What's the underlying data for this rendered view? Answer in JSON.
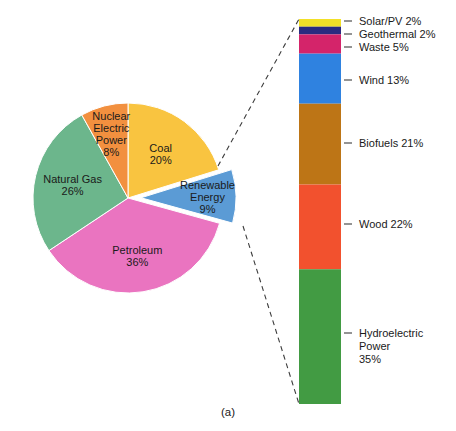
{
  "figure": {
    "caption": "(a)",
    "background": "#ffffff"
  },
  "chart_data": [
    {
      "type": "pie",
      "title": "",
      "name": "us-energy-consumption-by-source",
      "categories": [
        "Coal",
        "Renewable Energy",
        "Petroleum",
        "Natural Gas",
        "Nuclear Electric Power"
      ],
      "values": [
        20,
        9,
        36,
        26,
        8
      ],
      "unit": "%",
      "legend": "none",
      "exploded": [
        "Renewable Energy"
      ],
      "slices": [
        {
          "label": "Coal",
          "label_lines": [
            "Coal",
            "20%"
          ],
          "value": 20,
          "color": "#f9c440",
          "exploded": false
        },
        {
          "label": "Renewable Energy",
          "label_lines": [
            "Renewable",
            "Energy",
            "9%"
          ],
          "value": 9,
          "color": "#5b9bd5",
          "exploded": true
        },
        {
          "label": "Petroleum",
          "label_lines": [
            "Petroleum",
            "36%"
          ],
          "value": 36,
          "color": "#ea74c0",
          "exploded": false
        },
        {
          "label": "Natural Gas",
          "label_lines": [
            "Natural Gas",
            "26%"
          ],
          "value": 26,
          "color": "#6cb68c",
          "exploded": false
        },
        {
          "label": "Nuclear Electric Power",
          "label_lines": [
            "Nuclear",
            "Electric",
            "Power",
            "8%"
          ],
          "value": 8,
          "color": "#f2903f",
          "exploded": false
        }
      ]
    },
    {
      "type": "bar",
      "subtype": "stacked-vertical",
      "title": "",
      "name": "renewable-energy-breakdown",
      "categories": [
        "Solar/PV",
        "Geothermal",
        "Waste",
        "Wind",
        "Biofuels",
        "Wood",
        "Hydroelectric Power"
      ],
      "values": [
        2,
        2,
        5,
        13,
        21,
        22,
        35
      ],
      "unit": "%",
      "legend": "right-labels",
      "segments": [
        {
          "label": "Solar/PV",
          "label_lines": [
            "Solar/PV 2%"
          ],
          "value": 2,
          "color": "#f2e028"
        },
        {
          "label": "Geothermal",
          "label_lines": [
            "Geothermal 2%"
          ],
          "value": 2,
          "color": "#2b2b80"
        },
        {
          "label": "Waste",
          "label_lines": [
            "Waste 5%"
          ],
          "value": 5,
          "color": "#d4246a"
        },
        {
          "label": "Wind",
          "label_lines": [
            "Wind 13%"
          ],
          "value": 13,
          "color": "#2f82e0"
        },
        {
          "label": "Biofuels",
          "label_lines": [
            "Biofuels 21%"
          ],
          "value": 21,
          "color": "#bd7516"
        },
        {
          "label": "Wood",
          "label_lines": [
            "Wood 22%"
          ],
          "value": 22,
          "color": "#f2512e"
        },
        {
          "label": "Hydroelectric Power",
          "label_lines": [
            "Hydroelectric",
            "Power",
            "35%"
          ],
          "value": 35,
          "color": "#429b43"
        }
      ]
    }
  ]
}
